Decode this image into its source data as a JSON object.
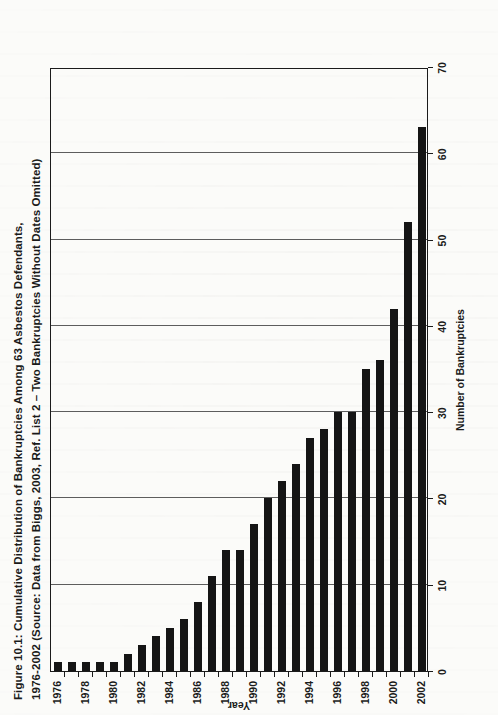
{
  "figure": {
    "title_line1": "Figure 10.1:  Cumulative Distribution of Bankruptcies Among 63 Asbestos Defendants,",
    "title_line2": "1976-2002 (Source:  Data from Biggs, 2003, Ref. List 2 – Two Bankruptcies Without Dates Omitted)"
  },
  "chart_data": {
    "type": "bar",
    "orientation": "horizontal",
    "title": "Figure 10.1:  Cumulative Distribution of Bankruptcies Among 63 Asbestos Defendants, 1976-2002 (Source:  Data from Biggs, 2003, Ref. List 2 – Two Bankruptcies Without Dates Omitted)",
    "xlabel": "Number of Bankruptcies",
    "ylabel": "Year",
    "xlim": [
      0,
      70
    ],
    "xticks": [
      0,
      10,
      20,
      30,
      40,
      50,
      60,
      70
    ],
    "xtick_labels": [
      "0",
      "10",
      "20",
      "30",
      "40",
      "50",
      "60",
      "70"
    ],
    "categories": [
      "1976",
      "1977",
      "1978",
      "1979",
      "1980",
      "1981",
      "1982",
      "1983",
      "1984",
      "1985",
      "1986",
      "1987",
      "1988",
      "1989",
      "1990",
      "1991",
      "1992",
      "1993",
      "1994",
      "1995",
      "1996",
      "1997",
      "1998",
      "1999",
      "2000",
      "2001",
      "2002"
    ],
    "ytick_labels": [
      "1976",
      "1978",
      "1980",
      "1982",
      "1984",
      "1986",
      "1988",
      "1990",
      "1992",
      "1994",
      "1996",
      "1998",
      "2000",
      "2002"
    ],
    "values": [
      1,
      1,
      1,
      1,
      1,
      2,
      3,
      4,
      5,
      6,
      8,
      11,
      14,
      14,
      17,
      20,
      22,
      24,
      27,
      28,
      30,
      30,
      35,
      36,
      42,
      52,
      63
    ],
    "grid": "vertical",
    "legend": "none",
    "bar_color": "#151515",
    "axis_color": "#1b1b1b",
    "grid_color": "#5d5d5d"
  }
}
